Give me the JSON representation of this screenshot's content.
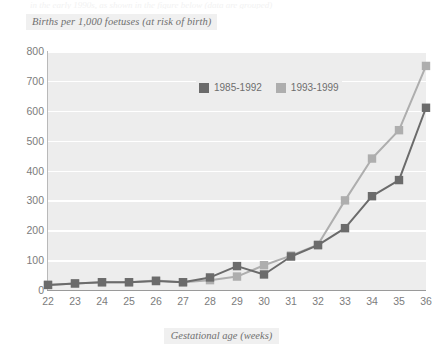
{
  "figure": {
    "top_cut_text": "in the early 1990s, as shown in the figure below (data are grouped)",
    "y_axis_title": "Births per 1,000 foetuses (at risk of birth)",
    "x_axis_title": "Gestational age (weeks)"
  },
  "legend": {
    "position": "inside-top-center",
    "items": [
      {
        "label": "1985-1992",
        "color": "#6b6b6b",
        "swatch_name": "legend-swatch-dark"
      },
      {
        "label": "1993-1999",
        "color": "#aeaeae",
        "swatch_name": "legend-swatch-light"
      }
    ]
  },
  "axes": {
    "y_ticks": [
      "800",
      "700",
      "600",
      "500",
      "400",
      "300",
      "200",
      "100",
      "0"
    ],
    "x_ticks": [
      "22",
      "23",
      "24",
      "25",
      "26",
      "27",
      "28",
      "29",
      "30",
      "31",
      "32",
      "33",
      "34",
      "35",
      "36"
    ]
  },
  "colors": {
    "plot_background": "#ededed",
    "gridline": "#ffffff",
    "axis": "#9a9a9a",
    "tick_label": "#7c7c7c",
    "title_text": "#6f6f6f",
    "series_dark": "#6b6b6b",
    "series_light": "#aeaeae"
  },
  "chart_data": {
    "type": "line",
    "title": "Births per 1,000 foetuses (at risk of birth)",
    "xlabel": "Gestational age (weeks)",
    "ylabel": "Births per 1,000 foetuses (at risk of birth)",
    "x": [
      22,
      23,
      24,
      25,
      26,
      27,
      28,
      29,
      30,
      31,
      32,
      33,
      34,
      35,
      36
    ],
    "categories": [
      "22",
      "23",
      "24",
      "25",
      "26",
      "27",
      "28",
      "29",
      "30",
      "31",
      "32",
      "33",
      "34",
      "35",
      "36"
    ],
    "xlim": [
      22,
      36
    ],
    "ylim": [
      0,
      800
    ],
    "yticks": [
      0,
      100,
      200,
      300,
      400,
      500,
      600,
      700,
      800
    ],
    "grid": true,
    "markers": "square",
    "legend_position": "inside-top-center",
    "series": [
      {
        "name": "1985-1992",
        "color": "#6b6b6b",
        "values": [
          17,
          22,
          26,
          26,
          30,
          26,
          42,
          80,
          52,
          112,
          150,
          207,
          314,
          368,
          610
        ]
      },
      {
        "name": "1993-1999",
        "color": "#aeaeae",
        "values": [
          17,
          22,
          26,
          26,
          32,
          26,
          33,
          45,
          83,
          115,
          152,
          300,
          440,
          535,
          750
        ]
      }
    ]
  }
}
